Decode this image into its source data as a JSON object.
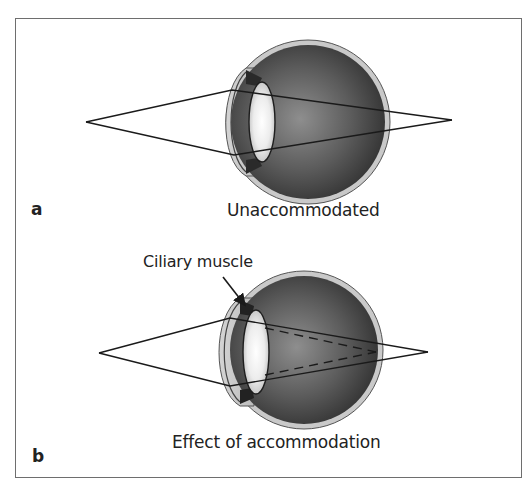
{
  "figure": {
    "panels": [
      {
        "letter": "a",
        "caption": "Unaccommodated",
        "eye": {
          "cx": 308,
          "cy": 122,
          "r": 82
        },
        "lens": {
          "cx": 262,
          "cy": 122,
          "rx": 13,
          "ry": 40
        },
        "rays": {
          "object_point": [
            86,
            122
          ],
          "image_point": [
            452,
            120
          ]
        }
      },
      {
        "letter": "b",
        "caption": "Effect of accommodation",
        "callout": "Ciliary muscle",
        "eye": {
          "cx": 304,
          "cy": 350,
          "r": 79
        },
        "lens": {
          "cx": 256,
          "cy": 352,
          "rx": 13,
          "ry": 42
        },
        "rays": {
          "object_point": [
            99,
            353
          ],
          "image_point": [
            428,
            352
          ],
          "accommodated_focus": [
            376,
            352
          ]
        }
      }
    ],
    "colors": {
      "frame": "#6e6e6e",
      "sclera": "#c9c9c9",
      "eye_interior_dark": "#2f2f2f",
      "eye_interior_light": "#8e8e8e",
      "lens_center": "#ffffff",
      "lens_edge": "#bdbdbd",
      "ray": "#1a1a1a"
    }
  }
}
